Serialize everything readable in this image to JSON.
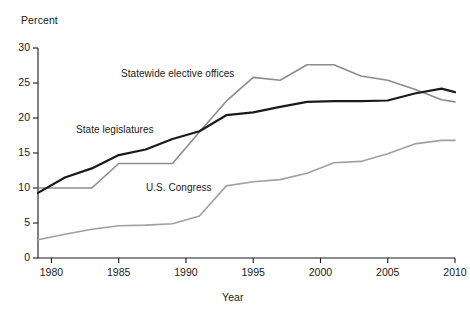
{
  "chart_data": {
    "type": "line",
    "title": "",
    "xlabel": "Year",
    "ylabel": "Percent",
    "xlim": [
      1979,
      2010
    ],
    "ylim": [
      0,
      30
    ],
    "grid": false,
    "legend_position": "inline-annotations",
    "xticks": [
      "1980",
      "1985",
      "1990",
      "1995",
      "2000",
      "2005",
      "2010"
    ],
    "xtick_values": [
      1980,
      1985,
      1990,
      1995,
      2000,
      2005,
      2010
    ],
    "yticks": [
      "0",
      "5",
      "10",
      "15",
      "20",
      "25",
      "30"
    ],
    "ytick_values": [
      0,
      5,
      10,
      15,
      20,
      25,
      30
    ],
    "x": [
      1979,
      1981,
      1983,
      1985,
      1987,
      1989,
      1991,
      1993,
      1995,
      1997,
      1999,
      2001,
      2003,
      2005,
      2007,
      2009,
      2010
    ],
    "series": [
      {
        "name": "Statewide elective offices",
        "color": "#8c8c8c",
        "values": [
          10.0,
          10.0,
          10.0,
          13.5,
          13.5,
          13.5,
          18.0,
          22.4,
          25.8,
          25.4,
          27.6,
          27.6,
          26.0,
          25.4,
          24.1,
          22.6,
          22.3
        ]
      },
      {
        "name": "State legislatures",
        "color": "#1a1a1a",
        "values": [
          9.3,
          11.5,
          12.8,
          14.7,
          15.5,
          17.0,
          18.1,
          20.4,
          20.8,
          21.6,
          22.3,
          22.4,
          22.4,
          22.5,
          23.5,
          24.2,
          23.7
        ]
      },
      {
        "name": "U.S. Congress",
        "color": "#a0a0a0",
        "values": [
          2.6,
          3.4,
          4.1,
          4.6,
          4.7,
          4.9,
          6.0,
          10.3,
          10.9,
          11.2,
          12.1,
          13.6,
          13.8,
          14.9,
          16.3,
          16.8,
          16.8
        ]
      }
    ],
    "annotations": [
      {
        "text": "Statewide elective offices",
        "series": "Statewide elective offices"
      },
      {
        "text": "State legislatures",
        "series": "State legislatures"
      },
      {
        "text": "U.S. Congress",
        "series": "U.S. Congress"
      }
    ]
  },
  "axes": {
    "y_title": "Percent",
    "x_title": "Year"
  }
}
